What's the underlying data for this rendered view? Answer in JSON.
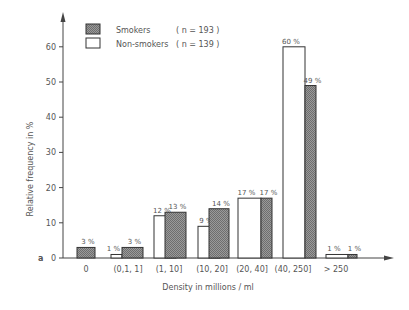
{
  "chart_data": {
    "type": "bar",
    "title": "",
    "panel_label": "a",
    "xlabel": "Density in millions / ml",
    "ylabel": "Relative frequency in %",
    "ylim": [
      0,
      65
    ],
    "yticks": [
      0,
      10,
      20,
      30,
      40,
      50,
      60
    ],
    "grid": false,
    "legend_position": "top-left",
    "categories": [
      "0",
      "(0,1, 1]",
      "(1, 10]",
      "(10, 20]",
      "(20, 40]",
      "(40, 250]",
      "> 250"
    ],
    "series": [
      {
        "name": "Smokers",
        "n_label": "( n = 193 )",
        "fill": "hatched-gray",
        "values": [
          3,
          3,
          13,
          14,
          17,
          49,
          1
        ],
        "labels": [
          "3 %",
          "3 %",
          "13 %",
          "14 %",
          "17 %",
          "49 %",
          "1 %"
        ]
      },
      {
        "name": "Non-smokers",
        "n_label": "( n = 139 )",
        "fill": "white",
        "values": [
          0,
          1,
          12,
          9,
          17,
          60,
          1
        ],
        "labels": [
          "",
          "1 %",
          "12 %",
          "9 %",
          "17 %",
          "60 %",
          "1 %"
        ]
      }
    ]
  },
  "colors": {
    "axis": "#444444",
    "hatch": "#888888",
    "outline": "#333333",
    "text": "#555555"
  }
}
